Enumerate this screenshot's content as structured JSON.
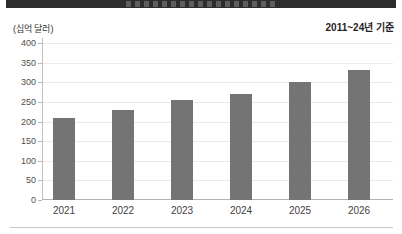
{
  "annotations": {
    "unit_label": "(십억 달러)",
    "basis_label": "2011~24년 기준"
  },
  "chart_data": {
    "type": "bar",
    "title": "",
    "categories": [
      "2021",
      "2022",
      "2023",
      "2024",
      "2025",
      "2026"
    ],
    "values": [
      210,
      230,
      255,
      270,
      300,
      330
    ],
    "xlabel": "",
    "ylabel": "(십억 달러)",
    "ylim": [
      0,
      400
    ],
    "ytick_step": 50,
    "yticks": [
      0,
      50,
      100,
      150,
      200,
      250,
      300,
      350,
      400
    ],
    "grid": true,
    "legend": false,
    "note": "2011~24년 기준",
    "bar_color": "#747474"
  },
  "colors": {
    "title_band": "#2d2d2d",
    "bar": "#747474",
    "gridline": "#eceae8",
    "axis": "#b4b2b0",
    "divider": "#c8c8c6",
    "text": "#3f3f3f"
  }
}
